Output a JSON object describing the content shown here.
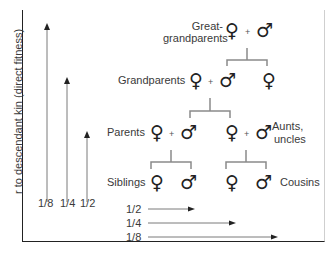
{
  "diagram": {
    "y_axis_label": "r to descendant kin (direct fitness)",
    "generations": [
      {
        "label": "Great-\ngrandparents",
        "line1": "Great-",
        "line2": "grandparents"
      },
      {
        "label": "Grandparents"
      },
      {
        "label": "Parents"
      },
      {
        "label": "Siblings"
      }
    ],
    "collateral_labels": {
      "aunts_uncles_1": "Aunts,",
      "aunts_uncles_2": "uncles",
      "cousins": "Cousins"
    },
    "symbols": {
      "female": "♀",
      "male": "♂",
      "plus": "+"
    },
    "vertical_arrows": [
      {
        "label": "1/8",
        "target": "Great-grandparents"
      },
      {
        "label": "1/4",
        "target": "Grandparents"
      },
      {
        "label": "1/2",
        "target": "Parents"
      }
    ],
    "horizontal_arrows": [
      {
        "label": "1/2",
        "target": "Siblings"
      },
      {
        "label": "1/4",
        "target": "Aunts, uncles"
      },
      {
        "label": "1/8",
        "target": "Cousins"
      }
    ],
    "colors": {
      "line": "#7a7a7a",
      "axis": "#222222",
      "bracket": "#8a8a8a"
    }
  }
}
